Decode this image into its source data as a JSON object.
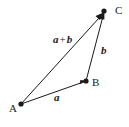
{
  "figure": {
    "kind": "vector-addition-triangle-diagram",
    "background_color": "#ffffff",
    "stroke_color": "#1a1a1a",
    "points": [
      {
        "name": "A",
        "label": "A",
        "x": 21,
        "y": 104
      },
      {
        "name": "B",
        "label": "B",
        "x": 86,
        "y": 81
      },
      {
        "name": "C",
        "label": "C",
        "x": 104,
        "y": 12
      }
    ],
    "vectors": [
      {
        "name": "a",
        "label": "a",
        "from": "A",
        "to": "B",
        "has_arrowhead": true
      },
      {
        "name": "b",
        "label": "b",
        "from": "B",
        "to": "C",
        "has_arrowhead": true
      },
      {
        "name": "a_plus_b",
        "label_left": "a",
        "label_operator": "+",
        "label_right": "b",
        "from": "A",
        "to": "C",
        "has_arrowhead": true
      }
    ]
  }
}
